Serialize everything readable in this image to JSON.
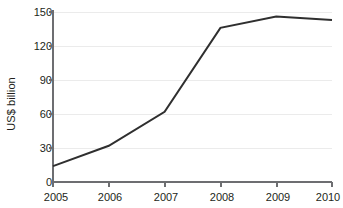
{
  "chart_data": {
    "type": "line",
    "title": "",
    "subtitle": "",
    "xlabel": "",
    "ylabel": "US$ billion",
    "categories": [
      "2005",
      "2006",
      "2007",
      "2008",
      "2009",
      "2010"
    ],
    "x": [
      2005,
      2006,
      2007,
      2008,
      2009,
      2010
    ],
    "values": [
      14,
      32,
      62,
      136,
      146,
      143
    ],
    "series": [
      {
        "name": "US$ billion",
        "values": [
          14,
          32,
          62,
          136,
          146,
          143
        ],
        "color": "#2f2f2f"
      }
    ],
    "xlim": [
      2005,
      2010
    ],
    "ylim": [
      0,
      150
    ],
    "y_ticks": [
      0,
      30,
      60,
      90,
      120,
      150
    ],
    "y_tick_labels": [
      "0",
      "30",
      "60",
      "90",
      "120",
      "150"
    ],
    "x_ticks": [
      2005,
      2006,
      2007,
      2008,
      2009,
      2010
    ],
    "x_tick_labels": [
      "2005",
      "2006",
      "2007",
      "2008",
      "2009",
      "2010"
    ],
    "grid": "horizontal",
    "grid_color": "#ebebeb",
    "legend": "none",
    "axis_color": "#6d6e71",
    "background": "#ffffff",
    "text_color": "#231f20"
  },
  "axes": {
    "y_title": "US$ billion",
    "y_labels": [
      "150",
      "120",
      "90",
      "60",
      "30",
      "0"
    ],
    "x_labels": [
      "2005",
      "2006",
      "2007",
      "2008",
      "2009",
      "2010"
    ]
  }
}
